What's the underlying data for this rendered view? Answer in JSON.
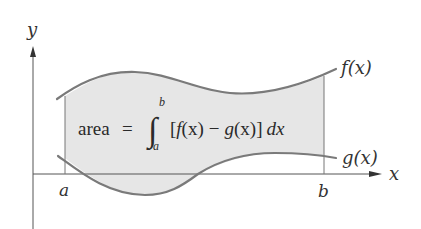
{
  "diagram": {
    "axes": {
      "x_label": "x",
      "y_label": "y"
    },
    "curves": {
      "upper": {
        "label": "f(x)"
      },
      "lower": {
        "label": "g(x)"
      }
    },
    "bounds": {
      "left": "a",
      "right": "b"
    },
    "formula": {
      "lhs": "area",
      "equals": "=",
      "integral_sign": "∫",
      "upper_limit": "b",
      "lower_limit": "a",
      "integrand_open": "[",
      "f": "f",
      "f_arg": "(x)",
      "minus": "−",
      "g": "g",
      "g_arg": "(x)",
      "integrand_close": "]",
      "differential": "dx"
    },
    "colors": {
      "fill": "#e6e6e6",
      "curve": "#7a7a7a",
      "axis": "#555555",
      "text": "#333333"
    }
  }
}
